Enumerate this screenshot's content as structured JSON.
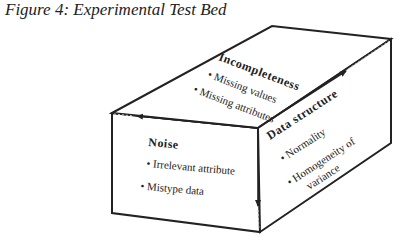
{
  "caption": "Figure 4: Experimental Test Bed",
  "colors": {
    "line": "#222222",
    "background": "#ffffff"
  },
  "faces": {
    "top": {
      "title": "Incompleteness",
      "items": [
        "• Missing values",
        "• Missing attributes"
      ]
    },
    "front": {
      "title": "Noise",
      "items": [
        "•  Irrelevant  attribute",
        "• Mistype  data"
      ]
    },
    "side": {
      "title": "Data  structure",
      "items": [
        "•  Normality",
        "•  Homogeneity  of",
        "variance"
      ]
    }
  }
}
